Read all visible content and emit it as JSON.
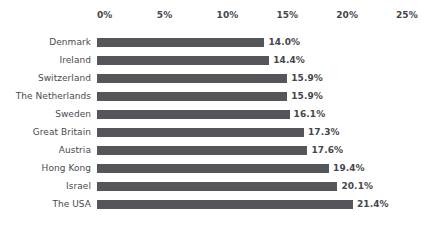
{
  "chart_data": {
    "type": "bar",
    "orientation": "horizontal",
    "title": "",
    "subtitle": "",
    "xlabel": "",
    "ylabel": "",
    "grid": false,
    "legend": null,
    "xlim": [
      0,
      25
    ],
    "axis_position": "top",
    "tick_labels": [
      "0%",
      "5%",
      "10%",
      "15%",
      "20%",
      "25%"
    ],
    "tick_values": [
      0,
      5,
      10,
      15,
      20,
      25
    ],
    "categories": [
      "Denmark",
      "Ireland",
      "Switzerland",
      "The Netherlands",
      "Sweden",
      "Great Britain",
      "Austria",
      "Hong Kong",
      "Israel",
      "The USA"
    ],
    "values": [
      14.0,
      14.4,
      15.9,
      15.9,
      16.1,
      17.3,
      17.6,
      19.4,
      20.1,
      21.4
    ],
    "value_labels": [
      "14.0%",
      "14.4%",
      "15.9%",
      "15.9%",
      "16.1%",
      "17.3%",
      "17.6%",
      "19.4%",
      "20.1%",
      "21.4%"
    ]
  },
  "style": {
    "bar_color": "#55565a",
    "category_label_color": "#4a4a4f",
    "value_label_color": "#45464b",
    "tick_label_color": "#45464b",
    "background_color": "#ffffff"
  },
  "geometry": {
    "axis_origin_x": 97,
    "px_per_percent": 11.96,
    "first_row_top": 34,
    "row_pitch": 18,
    "bar_height": 9,
    "value_label_gap": 4
  }
}
